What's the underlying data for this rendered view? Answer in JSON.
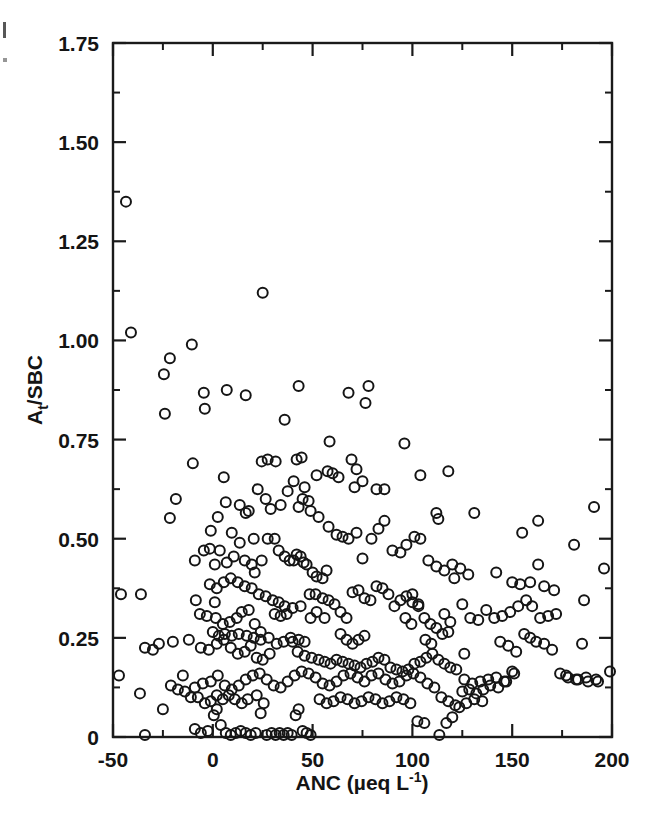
{
  "figure": {
    "background": "#ffffff",
    "ink_color": "#151515",
    "marker": "open-circle"
  },
  "chart_data": {
    "type": "scatter",
    "title": "",
    "xlabel": "ANC (µeq L⁻¹)",
    "xlabel_parts": {
      "prefix": "ANC (µeq L",
      "superscript": "-1",
      "suffix": ")"
    },
    "ylabel": "Aₜ/SBC",
    "ylabel_parts": {
      "prefix": "A",
      "subscript": "t",
      "suffix": "/SBC"
    },
    "xlim": [
      -50,
      200
    ],
    "ylim": [
      0,
      1.75
    ],
    "xticks": [
      -50,
      0,
      50,
      100,
      150,
      200
    ],
    "xticklabels": [
      "-50",
      "0",
      "50",
      "100",
      "150",
      "200"
    ],
    "xminor_step": 25,
    "yticks": [
      0,
      0.25,
      0.5,
      0.75,
      1.0,
      1.25,
      1.5,
      1.75
    ],
    "yticklabels": [
      "0",
      "0.25",
      "0.50",
      "0.75",
      "1.00",
      "1.25",
      "1.50",
      "1.75"
    ],
    "yminor_step": 0.125,
    "grid": false,
    "legend": null,
    "marker_size_px": 10,
    "n_points": 372,
    "points": [
      [
        -43.5,
        1.35
      ],
      [
        -41.0,
        1.02
      ],
      [
        -10.5,
        0.99
      ],
      [
        -21.5,
        0.955
      ],
      [
        -24.5,
        0.915
      ],
      [
        -24.0,
        0.815
      ],
      [
        25.0,
        1.12
      ],
      [
        -4.5,
        0.868
      ],
      [
        -4.0,
        0.828
      ],
      [
        7.0,
        0.875
      ],
      [
        16.5,
        0.862
      ],
      [
        36.0,
        0.8
      ],
      [
        43.0,
        0.885
      ],
      [
        68.0,
        0.868
      ],
      [
        78.0,
        0.885
      ],
      [
        76.5,
        0.842
      ],
      [
        -10.0,
        0.69
      ],
      [
        -18.5,
        0.6
      ],
      [
        -21.5,
        0.552
      ],
      [
        5.5,
        0.655
      ],
      [
        6.5,
        0.592
      ],
      [
        13.5,
        0.585
      ],
      [
        16.5,
        0.565
      ],
      [
        18.0,
        0.57
      ],
      [
        24.5,
        0.695
      ],
      [
        27.5,
        0.7
      ],
      [
        31.5,
        0.695
      ],
      [
        22.5,
        0.625
      ],
      [
        26.5,
        0.6
      ],
      [
        29.0,
        0.575
      ],
      [
        34.0,
        0.585
      ],
      [
        37.5,
        0.62
      ],
      [
        40.5,
        0.645
      ],
      [
        42.0,
        0.7
      ],
      [
        44.5,
        0.705
      ],
      [
        46.0,
        0.63
      ],
      [
        45.0,
        0.6
      ],
      [
        48.0,
        0.595
      ],
      [
        57.5,
        0.67
      ],
      [
        60.0,
        0.665
      ],
      [
        63.0,
        0.655
      ],
      [
        58.5,
        0.745
      ],
      [
        69.5,
        0.7
      ],
      [
        72.0,
        0.675
      ],
      [
        71.0,
        0.63
      ],
      [
        75.0,
        0.645
      ],
      [
        82.0,
        0.625
      ],
      [
        86.0,
        0.625
      ],
      [
        96.0,
        0.74
      ],
      [
        104.0,
        0.66
      ],
      [
        118.0,
        0.67
      ],
      [
        112.0,
        0.565
      ],
      [
        113.0,
        0.55
      ],
      [
        131.0,
        0.565
      ],
      [
        163.0,
        0.545
      ],
      [
        155.0,
        0.515
      ],
      [
        191.0,
        0.58
      ],
      [
        181.0,
        0.485
      ],
      [
        196.0,
        0.425
      ],
      [
        -9.0,
        0.445
      ],
      [
        -4.5,
        0.47
      ],
      [
        -1.5,
        0.475
      ],
      [
        1.0,
        0.435
      ],
      [
        3.5,
        0.47
      ],
      [
        7.0,
        0.44
      ],
      [
        10.5,
        0.455
      ],
      [
        13.5,
        0.49
      ],
      [
        16.0,
        0.445
      ],
      [
        19.5,
        0.435
      ],
      [
        21.0,
        0.415
      ],
      [
        24.5,
        0.445
      ],
      [
        27.5,
        0.5
      ],
      [
        31.0,
        0.5
      ],
      [
        33.0,
        0.47
      ],
      [
        36.0,
        0.455
      ],
      [
        38.5,
        0.445
      ],
      [
        40.5,
        0.445
      ],
      [
        42.0,
        0.46
      ],
      [
        44.0,
        0.455
      ],
      [
        45.5,
        0.44
      ],
      [
        47.0,
        0.435
      ],
      [
        50.0,
        0.415
      ],
      [
        52.0,
        0.405
      ],
      [
        55.0,
        0.4
      ],
      [
        57.0,
        0.42
      ],
      [
        53.0,
        0.555
      ],
      [
        58.0,
        0.53
      ],
      [
        62.0,
        0.51
      ],
      [
        65.0,
        0.505
      ],
      [
        68.0,
        0.5
      ],
      [
        72.0,
        0.515
      ],
      [
        75.0,
        0.45
      ],
      [
        79.5,
        0.5
      ],
      [
        83.0,
        0.525
      ],
      [
        86.0,
        0.545
      ],
      [
        90.0,
        0.47
      ],
      [
        94.0,
        0.465
      ],
      [
        97.0,
        0.485
      ],
      [
        101.0,
        0.505
      ],
      [
        104.0,
        0.5
      ],
      [
        108.0,
        0.445
      ],
      [
        112.0,
        0.43
      ],
      [
        116.0,
        0.42
      ],
      [
        120.0,
        0.435
      ],
      [
        124.0,
        0.425
      ],
      [
        128.0,
        0.41
      ],
      [
        121.0,
        0.4
      ],
      [
        142.0,
        0.415
      ],
      [
        150.0,
        0.39
      ],
      [
        154.0,
        0.385
      ],
      [
        159.0,
        0.39
      ],
      [
        163.0,
        0.435
      ],
      [
        166.0,
        0.38
      ],
      [
        171.0,
        0.37
      ],
      [
        186.0,
        0.345
      ],
      [
        -46.0,
        0.36
      ],
      [
        -36.0,
        0.36
      ],
      [
        -8.5,
        0.345
      ],
      [
        1.0,
        0.34
      ],
      [
        -6.5,
        0.31
      ],
      [
        -3.0,
        0.305
      ],
      [
        1.5,
        0.3
      ],
      [
        5.0,
        0.285
      ],
      [
        8.5,
        0.29
      ],
      [
        12.0,
        0.3
      ],
      [
        14.5,
        0.315
      ],
      [
        18.0,
        0.32
      ],
      [
        21.0,
        0.285
      ],
      [
        24.0,
        0.265
      ],
      [
        28.0,
        0.25
      ],
      [
        31.0,
        0.31
      ],
      [
        34.0,
        0.305
      ],
      [
        37.0,
        0.31
      ],
      [
        40.0,
        0.24
      ],
      [
        43.0,
        0.245
      ],
      [
        46.0,
        0.24
      ],
      [
        49.0,
        0.3
      ],
      [
        52.0,
        0.315
      ],
      [
        55.0,
        0.35
      ],
      [
        58.0,
        0.345
      ],
      [
        61.0,
        0.335
      ],
      [
        64.0,
        0.315
      ],
      [
        67.0,
        0.3
      ],
      [
        70.0,
        0.365
      ],
      [
        73.0,
        0.37
      ],
      [
        76.0,
        0.35
      ],
      [
        79.0,
        0.345
      ],
      [
        82.0,
        0.38
      ],
      [
        85.0,
        0.375
      ],
      [
        88.0,
        0.36
      ],
      [
        91.0,
        0.33
      ],
      [
        94.0,
        0.345
      ],
      [
        97.0,
        0.355
      ],
      [
        100.0,
        0.34
      ],
      [
        103.0,
        0.33
      ],
      [
        106.0,
        0.3
      ],
      [
        109.0,
        0.285
      ],
      [
        112.0,
        0.275
      ],
      [
        115.0,
        0.26
      ],
      [
        118.0,
        0.265
      ],
      [
        125.0,
        0.335
      ],
      [
        129.0,
        0.3
      ],
      [
        133.0,
        0.295
      ],
      [
        137.0,
        0.32
      ],
      [
        141.0,
        0.3
      ],
      [
        145.0,
        0.305
      ],
      [
        149.0,
        0.315
      ],
      [
        153.0,
        0.33
      ],
      [
        157.0,
        0.345
      ],
      [
        160.0,
        0.33
      ],
      [
        164.0,
        0.3
      ],
      [
        168.0,
        0.305
      ],
      [
        172.0,
        0.31
      ],
      [
        185.0,
        0.235
      ],
      [
        -34.0,
        0.225
      ],
      [
        -30.0,
        0.22
      ],
      [
        -27.0,
        0.235
      ],
      [
        -20.0,
        0.24
      ],
      [
        -12.0,
        0.245
      ],
      [
        -6.0,
        0.225
      ],
      [
        -2.0,
        0.22
      ],
      [
        2.0,
        0.235
      ],
      [
        5.5,
        0.245
      ],
      [
        9.0,
        0.225
      ],
      [
        12.5,
        0.21
      ],
      [
        16.0,
        0.215
      ],
      [
        19.0,
        0.23
      ],
      [
        22.0,
        0.2
      ],
      [
        25.0,
        0.195
      ],
      [
        28.5,
        0.21
      ],
      [
        32.0,
        0.235
      ],
      [
        35.5,
        0.24
      ],
      [
        39.0,
        0.25
      ],
      [
        42.5,
        0.215
      ],
      [
        46.0,
        0.205
      ],
      [
        49.5,
        0.2
      ],
      [
        53.0,
        0.195
      ],
      [
        56.0,
        0.19
      ],
      [
        59.0,
        0.185
      ],
      [
        62.0,
        0.195
      ],
      [
        65.0,
        0.19
      ],
      [
        68.0,
        0.185
      ],
      [
        71.0,
        0.18
      ],
      [
        74.0,
        0.175
      ],
      [
        77.0,
        0.185
      ],
      [
        80.0,
        0.19
      ],
      [
        83.0,
        0.2
      ],
      [
        86.0,
        0.195
      ],
      [
        89.0,
        0.175
      ],
      [
        92.0,
        0.17
      ],
      [
        95.0,
        0.165
      ],
      [
        98.0,
        0.17
      ],
      [
        101.0,
        0.185
      ],
      [
        104.0,
        0.19
      ],
      [
        107.0,
        0.2
      ],
      [
        110.0,
        0.21
      ],
      [
        113.0,
        0.195
      ],
      [
        116.0,
        0.185
      ],
      [
        119.0,
        0.175
      ],
      [
        122.0,
        0.17
      ],
      [
        126.0,
        0.145
      ],
      [
        130.0,
        0.135
      ],
      [
        134.0,
        0.14
      ],
      [
        138.0,
        0.145
      ],
      [
        142.0,
        0.15
      ],
      [
        146.0,
        0.14
      ],
      [
        150.0,
        0.165
      ],
      [
        156.0,
        0.26
      ],
      [
        159.0,
        0.25
      ],
      [
        162.0,
        0.24
      ],
      [
        166.0,
        0.235
      ],
      [
        170.0,
        0.22
      ],
      [
        174.0,
        0.16
      ],
      [
        178.0,
        0.15
      ],
      [
        182.0,
        0.145
      ],
      [
        188.0,
        0.14
      ],
      [
        192.0,
        0.145
      ],
      [
        199.0,
        0.165
      ],
      [
        -47.0,
        0.155
      ],
      [
        -36.5,
        0.11
      ],
      [
        -25.0,
        0.07
      ],
      [
        -15.0,
        0.155
      ],
      [
        -9.0,
        0.125
      ],
      [
        -5.0,
        0.135
      ],
      [
        -1.0,
        0.14
      ],
      [
        2.5,
        0.155
      ],
      [
        6.0,
        0.13
      ],
      [
        9.5,
        0.12
      ],
      [
        13.0,
        0.13
      ],
      [
        16.5,
        0.145
      ],
      [
        20.0,
        0.155
      ],
      [
        23.5,
        0.16
      ],
      [
        27.0,
        0.145
      ],
      [
        30.5,
        0.13
      ],
      [
        34.0,
        0.125
      ],
      [
        37.5,
        0.14
      ],
      [
        41.0,
        0.155
      ],
      [
        44.5,
        0.165
      ],
      [
        48.0,
        0.16
      ],
      [
        51.5,
        0.15
      ],
      [
        55.0,
        0.135
      ],
      [
        58.5,
        0.13
      ],
      [
        62.0,
        0.14
      ],
      [
        65.5,
        0.155
      ],
      [
        69.0,
        0.16
      ],
      [
        72.5,
        0.15
      ],
      [
        76.0,
        0.14
      ],
      [
        79.5,
        0.155
      ],
      [
        83.0,
        0.16
      ],
      [
        86.5,
        0.145
      ],
      [
        90.0,
        0.135
      ],
      [
        93.5,
        0.14
      ],
      [
        97.0,
        0.155
      ],
      [
        100.5,
        0.16
      ],
      [
        104.0,
        0.15
      ],
      [
        107.5,
        0.135
      ],
      [
        111.0,
        0.125
      ],
      [
        114.5,
        0.1
      ],
      [
        118.0,
        0.09
      ],
      [
        121.5,
        0.08
      ],
      [
        125.0,
        0.115
      ],
      [
        128.5,
        0.12
      ],
      [
        132.0,
        0.11
      ],
      [
        135.5,
        0.12
      ],
      [
        139.0,
        0.13
      ],
      [
        143.0,
        0.125
      ],
      [
        147.0,
        0.14
      ],
      [
        151.0,
        0.16
      ],
      [
        177.0,
        0.155
      ],
      [
        183.0,
        0.145
      ],
      [
        187.0,
        0.15
      ],
      [
        193.0,
        0.14
      ],
      [
        -34.0,
        0.005
      ],
      [
        -9.0,
        0.02
      ],
      [
        -6.0,
        0.01
      ],
      [
        -2.5,
        0.015
      ],
      [
        0.5,
        0.055
      ],
      [
        2.0,
        0.07
      ],
      [
        4.0,
        0.03
      ],
      [
        6.5,
        0.01
      ],
      [
        9.0,
        0.005
      ],
      [
        11.5,
        0.01
      ],
      [
        14.0,
        0.015
      ],
      [
        16.5,
        0.01
      ],
      [
        19.0,
        0.005
      ],
      [
        21.5,
        0.01
      ],
      [
        24.0,
        0.06
      ],
      [
        25.5,
        0.085
      ],
      [
        27.0,
        0.005
      ],
      [
        29.5,
        0.01
      ],
      [
        31.5,
        0.005
      ],
      [
        33.5,
        0.01
      ],
      [
        35.5,
        0.005
      ],
      [
        37.5,
        0.01
      ],
      [
        39.5,
        0.005
      ],
      [
        41.5,
        0.055
      ],
      [
        43.0,
        0.07
      ],
      [
        45.0,
        0.015
      ],
      [
        47.0,
        0.01
      ],
      [
        49.0,
        0.005
      ],
      [
        22.0,
        0.105
      ],
      [
        17.5,
        0.095
      ],
      [
        14.5,
        0.085
      ],
      [
        11.0,
        0.095
      ],
      [
        8.0,
        0.105
      ],
      [
        5.0,
        0.095
      ],
      [
        2.0,
        0.105
      ],
      [
        -1.0,
        0.09
      ],
      [
        -4.0,
        0.085
      ],
      [
        -7.5,
        0.1
      ],
      [
        -11.0,
        0.1
      ],
      [
        -14.0,
        0.115
      ],
      [
        -17.5,
        0.12
      ],
      [
        -21.0,
        0.13
      ],
      [
        53.5,
        0.095
      ],
      [
        57.0,
        0.085
      ],
      [
        60.5,
        0.09
      ],
      [
        64.0,
        0.1
      ],
      [
        67.5,
        0.095
      ],
      [
        71.0,
        0.085
      ],
      [
        74.5,
        0.09
      ],
      [
        78.0,
        0.1
      ],
      [
        81.5,
        0.095
      ],
      [
        85.0,
        0.085
      ],
      [
        88.5,
        0.09
      ],
      [
        92.0,
        0.1
      ],
      [
        95.5,
        0.095
      ],
      [
        99.0,
        0.085
      ],
      [
        102.5,
        0.04
      ],
      [
        106.0,
        0.035
      ],
      [
        113.5,
        0.005
      ],
      [
        117.0,
        0.035
      ],
      [
        120.0,
        0.05
      ],
      [
        123.5,
        0.075
      ],
      [
        127.0,
        0.085
      ],
      [
        131.0,
        0.095
      ],
      [
        135.0,
        0.09
      ],
      [
        56.0,
        0.3
      ],
      [
        48.5,
        0.36
      ],
      [
        51.5,
        0.36
      ],
      [
        44.0,
        0.33
      ],
      [
        40.0,
        0.325
      ],
      [
        36.0,
        0.33
      ],
      [
        33.0,
        0.34
      ],
      [
        30.0,
        0.345
      ],
      [
        26.5,
        0.355
      ],
      [
        23.0,
        0.36
      ],
      [
        19.5,
        0.375
      ],
      [
        16.0,
        0.38
      ],
      [
        12.5,
        0.39
      ],
      [
        9.0,
        0.4
      ],
      [
        5.5,
        0.39
      ],
      [
        2.0,
        0.375
      ],
      [
        -1.5,
        0.385
      ],
      [
        0.0,
        0.265
      ],
      [
        3.0,
        0.255
      ],
      [
        6.0,
        0.26
      ],
      [
        9.5,
        0.255
      ],
      [
        13.0,
        0.26
      ],
      [
        17.0,
        0.255
      ],
      [
        20.5,
        0.25
      ],
      [
        24.0,
        0.245
      ],
      [
        64.0,
        0.26
      ],
      [
        67.0,
        0.245
      ],
      [
        70.0,
        0.235
      ],
      [
        73.0,
        0.245
      ],
      [
        76.0,
        0.255
      ],
      [
        43.0,
        0.58
      ],
      [
        49.0,
        0.57
      ],
      [
        52.0,
        0.66
      ],
      [
        20.5,
        0.5
      ],
      [
        9.5,
        0.515
      ],
      [
        -1.0,
        0.52
      ],
      [
        2.5,
        0.555
      ],
      [
        100.0,
        0.36
      ],
      [
        103.0,
        0.335
      ],
      [
        96.5,
        0.3
      ],
      [
        99.5,
        0.285
      ],
      [
        106.5,
        0.245
      ],
      [
        109.5,
        0.235
      ],
      [
        126.0,
        0.21
      ],
      [
        116.0,
        0.31
      ],
      [
        119.0,
        0.29
      ],
      [
        144.0,
        0.24
      ],
      [
        148.0,
        0.23
      ],
      [
        152.0,
        0.215
      ]
    ]
  }
}
